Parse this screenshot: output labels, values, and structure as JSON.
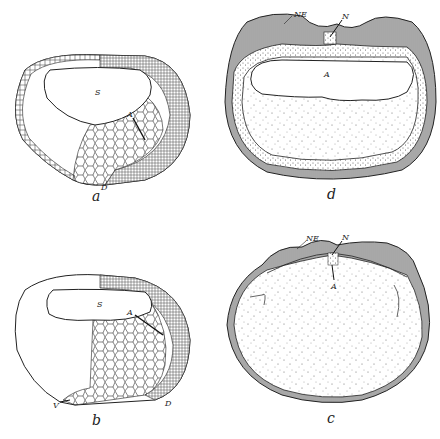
{
  "figure": {
    "panels": [
      {
        "id": "a",
        "caption": "a",
        "labels": {
          "cavity": "S",
          "line": "A",
          "bottom": "D"
        }
      },
      {
        "id": "b",
        "caption": "b",
        "labels": {
          "cavity": "S",
          "line": "A",
          "bottom_left": "V",
          "bottom_right": "D"
        }
      },
      {
        "id": "c",
        "caption": "c",
        "labels": {
          "top_left": "NE",
          "top_mid": "N",
          "inner": "A"
        }
      },
      {
        "id": "d",
        "caption": "d",
        "labels": {
          "top_left": "NE",
          "top_mid": "N",
          "cavity": "A"
        }
      }
    ]
  },
  "colors": {
    "ink": "#1a1a1a",
    "background": "#ffffff",
    "stipple": "#555555"
  }
}
